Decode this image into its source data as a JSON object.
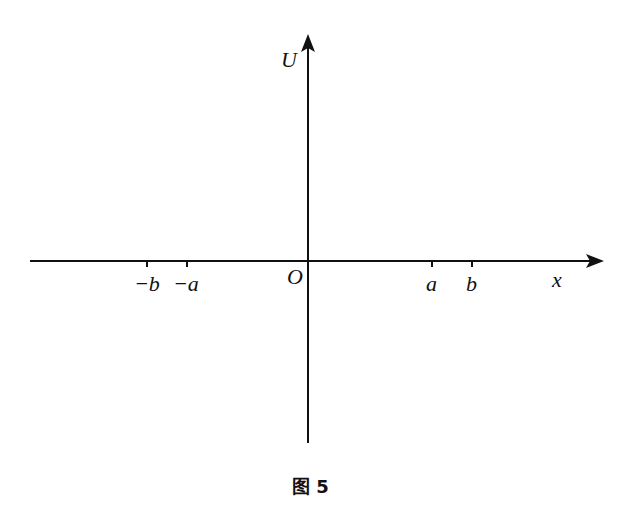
{
  "figure": {
    "caption": "图 5",
    "axes": {
      "x_label": "x",
      "y_label": "U",
      "origin_label": "O"
    },
    "x_ticks": [
      {
        "label": "−b",
        "px": 147
      },
      {
        "label": "−a",
        "px": 187
      },
      {
        "label": "a",
        "px": 432
      },
      {
        "label": "b",
        "px": 472
      }
    ],
    "colors": {
      "axis": "#111111",
      "background": "#ffffff"
    }
  }
}
